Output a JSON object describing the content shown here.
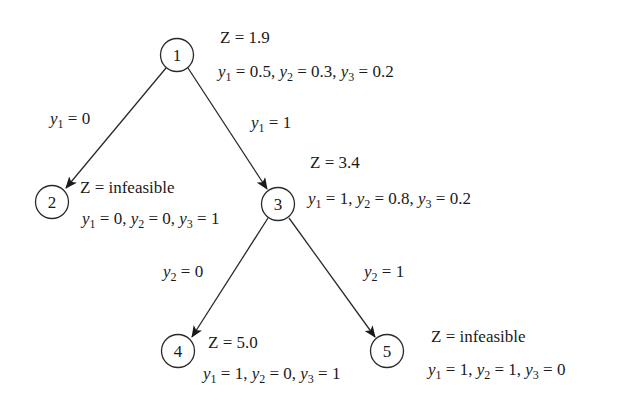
{
  "diagram": {
    "nodes": [
      {
        "id": "1",
        "label": "1",
        "cx": 177,
        "cy": 55
      },
      {
        "id": "2",
        "label": "2",
        "cx": 52,
        "cy": 202
      },
      {
        "id": "3",
        "label": "3",
        "cx": 278,
        "cy": 204
      },
      {
        "id": "4",
        "label": "4",
        "cx": 178,
        "cy": 351
      },
      {
        "id": "5",
        "label": "5",
        "cx": 387,
        "cy": 351
      }
    ],
    "edges": [
      {
        "from": "1",
        "to": "2",
        "label": {
          "var": "y",
          "sub": "1",
          "rest": " = 0"
        }
      },
      {
        "from": "1",
        "to": "3",
        "label": {
          "var": "y",
          "sub": "1",
          "rest": " = 1"
        }
      },
      {
        "from": "3",
        "to": "4",
        "label": {
          "var": "y",
          "sub": "2",
          "rest": " = 0"
        }
      },
      {
        "from": "3",
        "to": "5",
        "label": {
          "var": "y",
          "sub": "2",
          "rest": " = 1"
        }
      }
    ],
    "annotations": {
      "n1": {
        "z": "Z = 1.9",
        "y1": " = 0.5, ",
        "y2": " = 0.3, ",
        "y3": " = 0.2"
      },
      "n2": {
        "z": "Z = infeasible",
        "y1": " = 0, ",
        "y2": " = 0, ",
        "y3": " = 1"
      },
      "n3": {
        "z": "Z = 3.4",
        "y1": " = 1, ",
        "y2": " = 0.8, ",
        "y3": " = 0.2"
      },
      "n4": {
        "z": "Z = 5.0",
        "y1": " = 1, ",
        "y2": " = 0, ",
        "y3": " = 1"
      },
      "n5": {
        "z": "Z = infeasible",
        "y1": " = 1, ",
        "y2": " = 1, ",
        "y3": " = 0"
      }
    },
    "symbols": {
      "var": "y",
      "s1": "1",
      "s2": "2",
      "s3": "3"
    },
    "colors": {
      "stroke": "#2a2a2a",
      "text": "#1a1a1a",
      "background": "#ffffff"
    }
  }
}
